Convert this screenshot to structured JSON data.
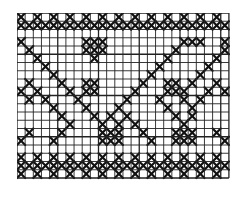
{
  "pattern": {
    "title": "Cross-stitch chart",
    "cols": 26,
    "rows": 20,
    "cell_w": 8.15,
    "cell_h": 8.25,
    "grid_color": "#222222",
    "stitch_color": "#111111",
    "background": "#ffffff",
    "rows_data": [
      "X.X.X.X.X.X.X.X.X.X.X.X.X.",
      "XXXXXXXXXXXXXXXXXXXXXXXXXX",
      "..........................",
      "X.......XXX.........XXX..X",
      ".X......XXX........X.....X",
      "..X......X........X.....X.",
      "...X.............X.....X..",
      "....X...........X.....X...",
      ".X...X..XX.....X..XX.X..X.",
      "X.X...X.XX....X...XXX..X.X",
      ".X.X...X.....X...X..X.X...",
      "....X...X...X.....X..X....",
      ".....X...X.X.X.....X.X....",
      "......X...X.X.X.....X.....",
      ".X...X....XXX..X...XXX..X.",
      "X...X.....XXX...X..XXX...X",
      "..........................",
      "X.X.X.X.X.X.X.X.X.X.X.X.X.",
      "XXXXXXXXXXXXXXXXXXXXXXXXXX",
      "X.X.X.X.X.X.X.X.X.X.X.X.X."
    ]
  }
}
